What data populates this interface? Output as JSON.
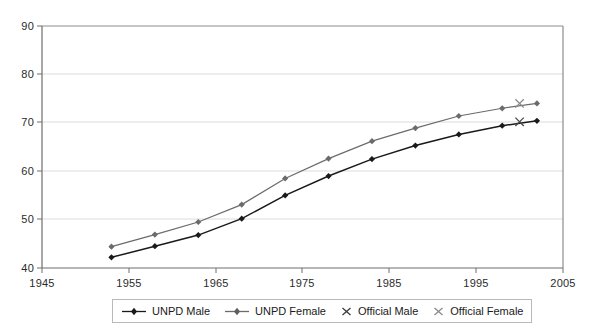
{
  "chart_data": {
    "type": "line",
    "title": "",
    "xlabel": "",
    "ylabel": "",
    "xlim": [
      1945,
      2005
    ],
    "ylim": [
      40,
      90
    ],
    "xticks": [
      1945,
      1955,
      1965,
      1975,
      1985,
      1995,
      2005
    ],
    "yticks": [
      40,
      50,
      60,
      70,
      80,
      90
    ],
    "grid": "horizontal",
    "legend_position": "bottom",
    "series": [
      {
        "name": "UNPD Male",
        "marker": "diamond",
        "color": "#1a1a1a",
        "x": [
          1953,
          1958,
          1963,
          1968,
          1973,
          1978,
          1983,
          1988,
          1993,
          1998,
          2002
        ],
        "values": [
          42.2,
          44.5,
          46.8,
          50.2,
          55.0,
          59.0,
          62.5,
          65.3,
          67.6,
          69.4,
          70.4
        ]
      },
      {
        "name": "UNPD Female",
        "marker": "diamond",
        "color": "#6b6b6b",
        "x": [
          1953,
          1958,
          1963,
          1968,
          1973,
          1978,
          1983,
          1988,
          1993,
          1998,
          2002
        ],
        "values": [
          44.4,
          46.9,
          49.5,
          53.1,
          58.5,
          62.6,
          66.2,
          68.9,
          71.4,
          73.0,
          74.0
        ]
      },
      {
        "name": "Official Male",
        "marker": "cross",
        "color": "#4a4a4a",
        "x": [
          2000
        ],
        "values": [
          70.2
        ]
      },
      {
        "name": "Official Female",
        "marker": "cross",
        "color": "#8a8a8a",
        "x": [
          2000
        ],
        "values": [
          74.0
        ]
      }
    ]
  },
  "legend": {
    "items": [
      {
        "label": "UNPD Male",
        "marker": "line-diamond",
        "color": "#1a1a1a"
      },
      {
        "label": "UNPD Female",
        "marker": "line-diamond",
        "color": "#6b6b6b"
      },
      {
        "label": "Official Male",
        "marker": "cross",
        "color": "#4a4a4a"
      },
      {
        "label": "Official Female",
        "marker": "cross",
        "color": "#8a8a8a"
      }
    ]
  },
  "axes": {
    "y_labels": [
      "90",
      "80",
      "70",
      "60",
      "50",
      "40"
    ],
    "x_labels": [
      "1945",
      "1955",
      "1965",
      "1975",
      "1985",
      "1995",
      "2005"
    ]
  }
}
